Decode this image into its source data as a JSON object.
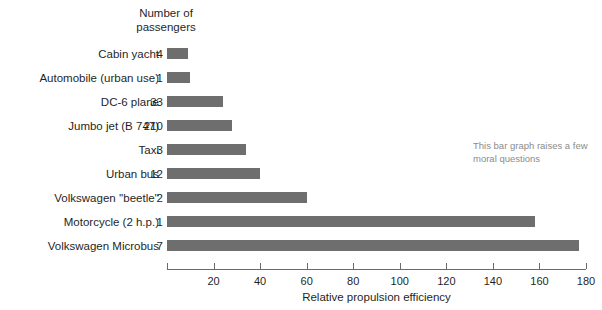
{
  "header": {
    "count_column_title": "Number of\npassengers"
  },
  "annotation": {
    "text": "This bar graph raises a few moral questions"
  },
  "axis": {
    "title": "Relative propulsion efficiency",
    "ticks": [
      0,
      20,
      40,
      60,
      80,
      100,
      120,
      140,
      160,
      180
    ],
    "tick_labels": [
      "",
      "20",
      "40",
      "60",
      "80",
      "100",
      "120",
      "140",
      "160",
      "180"
    ],
    "min": 0,
    "max": 180
  },
  "colors": {
    "bar": "#6e6e6e",
    "axis": "#6a6a6a",
    "text": "#1f1f1f",
    "annotation": "#8b8b8b",
    "background": "#ffffff"
  },
  "chart_data": {
    "type": "bar",
    "orientation": "horizontal",
    "title": "",
    "xlabel": "Relative propulsion efficiency",
    "ylabel": "",
    "xlim": [
      0,
      180
    ],
    "grid": false,
    "legend": null,
    "annotations": [
      "This bar graph raises a few moral questions"
    ],
    "extra_column": {
      "header": "Number of passengers",
      "values": [
        4,
        1,
        33,
        210,
        3,
        12,
        2,
        1,
        7
      ]
    },
    "categories": [
      "Cabin yacht",
      "Automobile (urban use)",
      "DC-6 plane",
      "Jumbo jet (B 747)",
      "Taxi",
      "Urban bus",
      "Volkswagen ''beetle''",
      "Motorcycle (2 h.p.)",
      "Volkswagen Microbus"
    ],
    "values": [
      9,
      10,
      24,
      28,
      34,
      40,
      60,
      158,
      177
    ]
  },
  "rows": [
    {
      "label": "Cabin yacht",
      "count": "4",
      "value": 9
    },
    {
      "label": "Automobile (urban use)",
      "count": "1",
      "value": 10
    },
    {
      "label": "DC-6 plane",
      "count": "33",
      "value": 24
    },
    {
      "label": "Jumbo jet (B 747)",
      "count": "210",
      "value": 28
    },
    {
      "label": "Taxi",
      "count": "3",
      "value": 34
    },
    {
      "label": "Urban bus",
      "count": "12",
      "value": 40
    },
    {
      "label": "Volkswagen ''beetle''",
      "count": "2",
      "value": 60
    },
    {
      "label": "Motorcycle (2 h.p.)",
      "count": "1",
      "value": 158
    },
    {
      "label": "Volkswagen Microbus",
      "count": "7",
      "value": 177
    }
  ]
}
